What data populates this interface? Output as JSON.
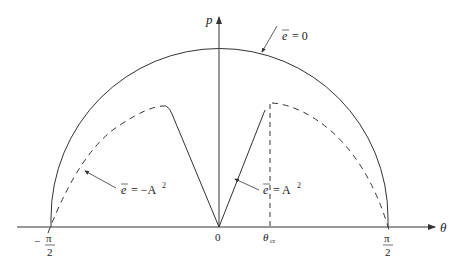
{
  "diagram": {
    "type": "phase-portrait",
    "axes": {
      "x_label": "θ",
      "y_label": "p",
      "x_ticks": [
        {
          "label_num": "π",
          "label_den": "2",
          "sign": "−",
          "value": "-π/2"
        },
        {
          "label": "0",
          "value": "0"
        },
        {
          "label": "θ",
          "sub": "cr",
          "value": "θcr"
        },
        {
          "label_num": "π",
          "label_den": "2",
          "sign": "",
          "value": "π/2"
        }
      ]
    },
    "curves": [
      {
        "name": "e-bar = 0",
        "style": "solid",
        "shape": "semicircle"
      },
      {
        "name": "e-bar = -A^2",
        "style": "dashed+solid"
      },
      {
        "name": "e-bar = A^2",
        "style": "solid+dashed"
      }
    ],
    "annotations": {
      "e_zero": {
        "lhs": "e",
        "rhs": "= 0"
      },
      "e_neg": {
        "lhs": "e",
        "rhs": "= −A",
        "sup": "2"
      },
      "e_pos": {
        "lhs": "e",
        "rhs": "= A",
        "sup": "2"
      }
    },
    "colors": {
      "line": "#333333",
      "background": "#ffffff"
    }
  }
}
